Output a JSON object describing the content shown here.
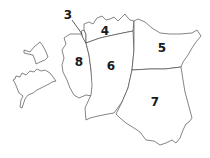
{
  "map": {
    "type": "region outline map",
    "regions": [
      {
        "id": "3",
        "label": "3"
      },
      {
        "id": "4",
        "label": "4"
      },
      {
        "id": "5",
        "label": "5"
      },
      {
        "id": "6",
        "label": "6"
      },
      {
        "id": "7",
        "label": "7"
      },
      {
        "id": "8",
        "label": "8"
      }
    ],
    "islands": [
      {
        "id": "island-north",
        "label": ""
      },
      {
        "id": "island-south",
        "label": ""
      }
    ],
    "colors": {
      "fill": "#ffffff",
      "stroke": "#333333",
      "label": "#1a1a1a"
    }
  }
}
